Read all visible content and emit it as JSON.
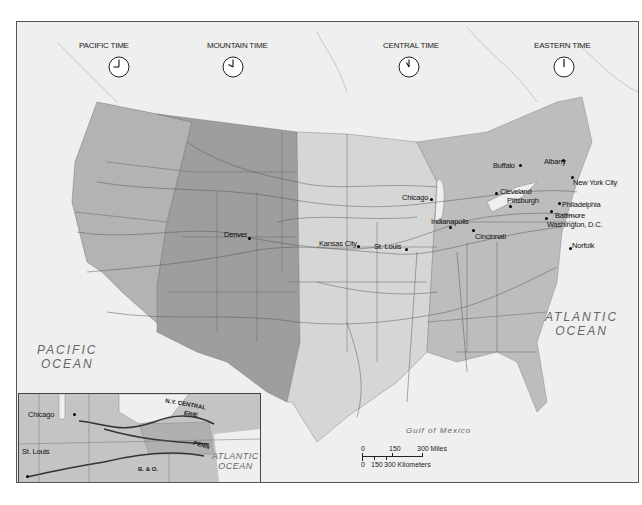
{
  "map": {
    "title": "U.S. Standard Time Zones and Railroads",
    "time_zones": [
      {
        "label": "PACIFIC TIME",
        "clock_time": "9:00"
      },
      {
        "label": "MOUNTAIN TIME",
        "clock_time": "10:00"
      },
      {
        "label": "CENTRAL TIME",
        "clock_time": "11:00"
      },
      {
        "label": "EASTERN TIME",
        "clock_time": "12:00"
      }
    ],
    "zone_colors": {
      "pacific": "#b3b3b3",
      "mountain": "#9e9e9e",
      "central": "#d6d6d6",
      "eastern": "#bdbdbd",
      "water": "#efefef"
    },
    "water_labels": {
      "pacific": [
        "PACIFIC",
        "OCEAN"
      ],
      "atlantic": [
        "ATLANTIC",
        "OCEAN"
      ],
      "gulf": "Gulf of Mexico"
    },
    "cities": [
      {
        "name": "Buffalo"
      },
      {
        "name": "Albany"
      },
      {
        "name": "New York City"
      },
      {
        "name": "Chicago"
      },
      {
        "name": "Cleveland"
      },
      {
        "name": "Pittsburgh"
      },
      {
        "name": "Philadelphia"
      },
      {
        "name": "Baltimore"
      },
      {
        "name": "Washington, D.C."
      },
      {
        "name": "Indianapolis"
      },
      {
        "name": "Cincinnati"
      },
      {
        "name": "Norfolk"
      },
      {
        "name": "Denver"
      },
      {
        "name": "Kansas City"
      },
      {
        "name": "St. Louis"
      }
    ],
    "scale": {
      "miles_ticks": [
        "0",
        "150",
        "300 Miles"
      ],
      "km_ticks": [
        "0",
        "150",
        "300 Kilometers"
      ]
    },
    "inset": {
      "cities": [
        "Chicago",
        "St. Louis"
      ],
      "railroads": [
        "N.Y. CENTRAL",
        "ERIE",
        "PENN",
        "B. & O."
      ],
      "ocean": [
        "ATLANTIC",
        "OCEAN"
      ]
    }
  }
}
